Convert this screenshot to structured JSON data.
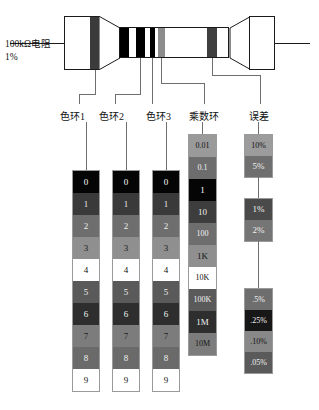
{
  "diagram": {
    "title_note_line1": "100kΩ电阻",
    "title_note_line2": "1%",
    "columns": [
      {
        "label": "色环1"
      },
      {
        "label": "色环2"
      },
      {
        "label": "色环3"
      },
      {
        "label": "乘数环"
      },
      {
        "label": "误差"
      }
    ]
  },
  "resistor": {
    "bands": [
      {
        "name": "left-cap-band",
        "color": "#3b3b3b"
      },
      {
        "name": "band-1",
        "color": "#000000"
      },
      {
        "name": "band-2",
        "color": "#000000"
      },
      {
        "name": "band-3",
        "color": "#000000"
      },
      {
        "name": "band-multiplier",
        "color": "#8c8c8c"
      },
      {
        "name": "band-tolerance",
        "color": "#3f3f3f"
      }
    ],
    "body_color": "#ffffff",
    "outline_color": "#1b1b1b"
  },
  "digit_column": {
    "cells": [
      {
        "label": "0",
        "bg": "#050505",
        "fg": "#ffffff"
      },
      {
        "label": "1",
        "bg": "#3a3a3a",
        "fg": "#e8e8e8"
      },
      {
        "label": "2",
        "bg": "#6e6e6e",
        "fg": "#efefef"
      },
      {
        "label": "3",
        "bg": "#8f8f8f",
        "fg": "#1a1a1a"
      },
      {
        "label": "4",
        "bg": "#ffffff",
        "fg": "#111111"
      },
      {
        "label": "5",
        "bg": "#5a5a5a",
        "fg": "#f0f0f0"
      },
      {
        "label": "6",
        "bg": "#2e2e2e",
        "fg": "#f0f0f0"
      },
      {
        "label": "7",
        "bg": "#7c7c7c",
        "fg": "#1c1c1c"
      },
      {
        "label": "8",
        "bg": "#6a6a6a",
        "fg": "#efefef"
      },
      {
        "label": "9",
        "bg": "#ffffff",
        "fg": "#111111"
      }
    ]
  },
  "multiplier_column": {
    "cells": [
      {
        "label": "0.01",
        "bg": "#9a9a9a",
        "fg": "#111111"
      },
      {
        "label": "0.1",
        "bg": "#6d6d6d",
        "fg": "#f2f2f2"
      },
      {
        "label": "1",
        "bg": "#050505",
        "fg": "#ffffff"
      },
      {
        "label": "10",
        "bg": "#3d3d3d",
        "fg": "#ededed"
      },
      {
        "label": "100",
        "bg": "#6e6e6e",
        "fg": "#f2f2f2"
      },
      {
        "label": "1K",
        "bg": "#8f8f8f",
        "fg": "#141414"
      },
      {
        "label": "10K",
        "bg": "#ffffff",
        "fg": "#111111"
      },
      {
        "label": "100K",
        "bg": "#5a5a5a",
        "fg": "#f2f2f2"
      },
      {
        "label": "1M",
        "bg": "#2e2e2e",
        "fg": "#f2f2f2"
      },
      {
        "label": "10M",
        "bg": "#7c7c7c",
        "fg": "#151515"
      }
    ]
  },
  "tolerance_column": {
    "groups": [
      {
        "name": "tolerance-group-top",
        "cells": [
          {
            "label": "10%",
            "bg": "#9c9c9c",
            "fg": "#111111"
          },
          {
            "label": "5%",
            "bg": "#6f6f6f",
            "fg": "#f0f0f0"
          }
        ]
      },
      {
        "name": "tolerance-group-middle",
        "cells": [
          {
            "label": "1%",
            "bg": "#4a4a4a",
            "fg": "#f0f0f0"
          },
          {
            "label": "2%",
            "bg": "#757575",
            "fg": "#f0f0f0"
          }
        ]
      },
      {
        "name": "tolerance-group-bottom",
        "cells": [
          {
            "label": ".5%",
            "bg": "#6e6e6e",
            "fg": "#f2f2f2"
          },
          {
            "label": ".25%",
            "bg": "#171717",
            "fg": "#f2f2f2"
          },
          {
            "label": ".10%",
            "bg": "#888888",
            "fg": "#141414"
          },
          {
            "label": ".05%",
            "bg": "#5a5a5a",
            "fg": "#f2f2f2"
          }
        ]
      }
    ]
  }
}
